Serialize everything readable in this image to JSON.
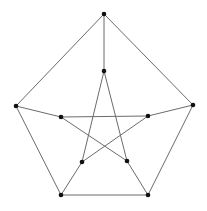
{
  "diagram": {
    "type": "graph",
    "name": "Petersen graph",
    "colors": {
      "edge": "#6b6b6b",
      "node": "#111111",
      "background": "#ffffff"
    },
    "nodes": [
      {
        "id": "o0",
        "x": 104,
        "y": 14
      },
      {
        "id": "o1",
        "x": 193,
        "y": 105
      },
      {
        "id": "o2",
        "x": 148,
        "y": 195
      },
      {
        "id": "o3",
        "x": 61,
        "y": 195
      },
      {
        "id": "o4",
        "x": 16,
        "y": 106
      },
      {
        "id": "i0",
        "x": 104,
        "y": 71
      },
      {
        "id": "i1",
        "x": 148,
        "y": 116
      },
      {
        "id": "i2",
        "x": 127,
        "y": 161
      },
      {
        "id": "i3",
        "x": 82,
        "y": 162
      },
      {
        "id": "i4",
        "x": 61,
        "y": 117
      }
    ],
    "edges": [
      [
        "o0",
        "o1"
      ],
      [
        "o1",
        "o2"
      ],
      [
        "o2",
        "o3"
      ],
      [
        "o3",
        "o4"
      ],
      [
        "o4",
        "o0"
      ],
      [
        "o0",
        "i0"
      ],
      [
        "o1",
        "i1"
      ],
      [
        "o2",
        "i2"
      ],
      [
        "o3",
        "i3"
      ],
      [
        "o4",
        "i4"
      ],
      [
        "i0",
        "i2"
      ],
      [
        "i2",
        "i4"
      ],
      [
        "i4",
        "i1"
      ],
      [
        "i1",
        "i3"
      ],
      [
        "i3",
        "i0"
      ]
    ]
  }
}
